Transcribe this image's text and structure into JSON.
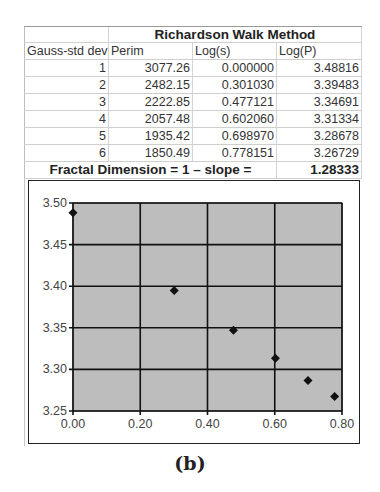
{
  "table": {
    "title": "Richardson Walk Method",
    "headers": [
      "Gauss-std dev",
      "Perim",
      "Log(s)",
      "Log(P)"
    ],
    "rows": [
      [
        "1",
        "3077.26",
        "0.000000",
        "3.48816"
      ],
      [
        "2",
        "2482.15",
        "0.301030",
        "3.39483"
      ],
      [
        "3",
        "2222.85",
        "0.477121",
        "3.34691"
      ],
      [
        "4",
        "2057.48",
        "0.602060",
        "3.31334"
      ],
      [
        "5",
        "1935.42",
        "0.698970",
        "3.28678"
      ],
      [
        "6",
        "1850.49",
        "0.778151",
        "3.26729"
      ]
    ],
    "fractal_label": "Fractal Dimension = 1 – slope =",
    "fractal_value": "1.28333"
  },
  "caption": "(b)",
  "chart_data": {
    "type": "scatter",
    "title": "",
    "xlabel": "",
    "ylabel": "",
    "x": [
      0.0,
      0.30103,
      0.477121,
      0.60206,
      0.69897,
      0.778151
    ],
    "y": [
      3.48816,
      3.39483,
      3.34691,
      3.31334,
      3.28678,
      3.26729
    ],
    "xlim": [
      0.0,
      0.8
    ],
    "ylim": [
      3.25,
      3.5
    ],
    "xticks": [
      "0.00",
      "0.20",
      "0.40",
      "0.60",
      "0.80"
    ],
    "yticks": [
      "3.25",
      "3.30",
      "3.35",
      "3.40",
      "3.45",
      "3.50"
    ],
    "grid": true,
    "legend": "none",
    "marker": "diamond",
    "plot_bg": "#bdbdbd"
  }
}
